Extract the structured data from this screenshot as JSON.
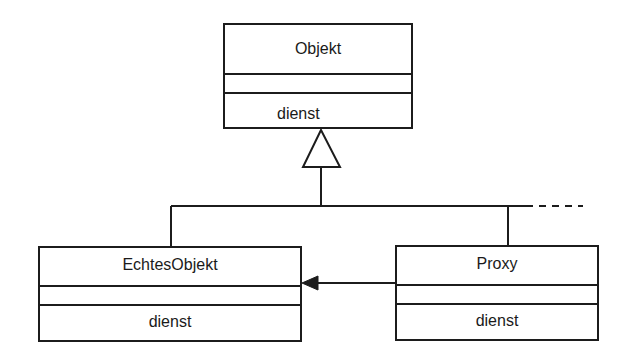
{
  "diagram": {
    "type": "uml-class-diagram",
    "pattern": "Proxy",
    "classes": [
      {
        "id": "objekt",
        "name": "Objekt",
        "attributes": [],
        "operations": [
          "dienst"
        ],
        "abstract_parent": true
      },
      {
        "id": "echtesobjekt",
        "name": "EchtesObjekt",
        "attributes": [],
        "operations": [
          "dienst"
        ]
      },
      {
        "id": "proxy",
        "name": "Proxy",
        "attributes": [],
        "operations": [
          "dienst"
        ]
      }
    ],
    "relations": [
      {
        "type": "generalization",
        "from": "echtesobjekt",
        "to": "objekt"
      },
      {
        "type": "generalization",
        "from": "proxy",
        "to": "objekt"
      },
      {
        "type": "generalization-continuation",
        "from": "(further subclasses)",
        "to": "objekt",
        "style": "dashed"
      },
      {
        "type": "association",
        "from": "proxy",
        "to": "echtesobjekt",
        "navigable": "to",
        "arrowhead": "filled"
      }
    ],
    "colors": {
      "line": "#1c1c1c",
      "text": "#1a1a1a",
      "background": "#ffffff"
    }
  }
}
